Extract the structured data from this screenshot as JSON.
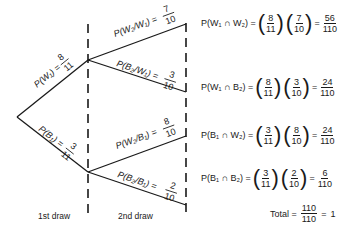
{
  "diagram": {
    "type": "probability-tree",
    "first_draw": [
      {
        "label": "P(W₁) =",
        "num": "8",
        "den": "11"
      },
      {
        "label": "P(B₁) =",
        "num": "3",
        "den": "11"
      }
    ],
    "second_draw": [
      {
        "label": "P(W₂/W₁) =",
        "num": "7",
        "den": "10"
      },
      {
        "label": "P(B₂/W₁) =",
        "num": "3",
        "den": "10"
      },
      {
        "label": "P(W₂/B₁) =",
        "num": "8",
        "den": "10"
      },
      {
        "label": "P(B₂/B₁) =",
        "num": "2",
        "den": "10"
      }
    ],
    "axis_labels": {
      "first": "1st draw",
      "second": "2nd draw"
    },
    "results": [
      {
        "lhs": "P(W₁ ∩ W₂) =",
        "f1n": "8",
        "f1d": "11",
        "f2n": "7",
        "f2d": "10",
        "rn": "56",
        "rd": "110"
      },
      {
        "lhs": "P(W₁ ∩ B₂) =",
        "f1n": "8",
        "f1d": "11",
        "f2n": "3",
        "f2d": "10",
        "rn": "24",
        "rd": "110"
      },
      {
        "lhs": "P(B₁ ∩ W₂) =",
        "f1n": "3",
        "f1d": "11",
        "f2n": "8",
        "f2d": "10",
        "rn": "24",
        "rd": "110"
      },
      {
        "lhs": "P(B₁ ∩ B₂) =",
        "f1n": "3",
        "f1d": "11",
        "f2n": "2",
        "f2d": "10",
        "rn": "6",
        "rd": "110"
      }
    ],
    "total": {
      "label": "Total =",
      "num": "110",
      "den": "110",
      "eq": "=",
      "value": "1"
    },
    "equals": "="
  }
}
